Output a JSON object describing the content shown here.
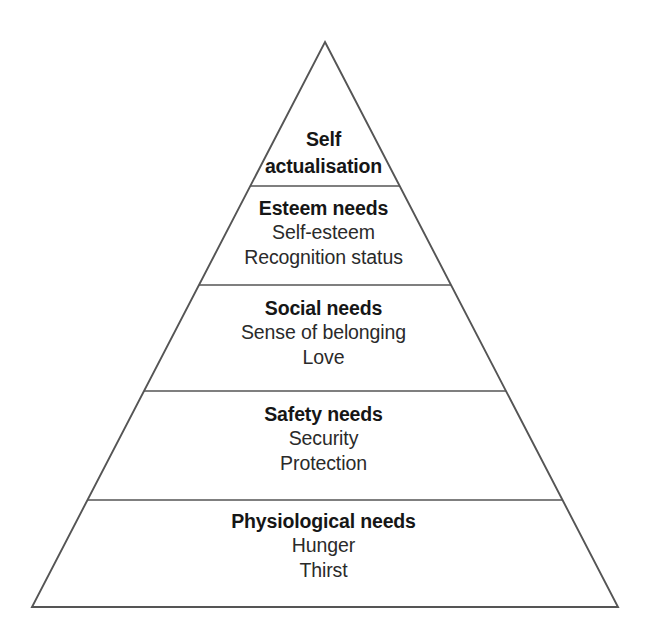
{
  "figure": {
    "name": "hierarchy-of-needs-pyramid",
    "shape": "triangle",
    "background_color": "#ffffff",
    "line_color": "#555555",
    "text_color": "#1a1a1a"
  },
  "geometry": {
    "apex": {
      "x": 325,
      "y": 42
    },
    "base_left": {
      "x": 32,
      "y": 607
    },
    "base_right": {
      "x": 618,
      "y": 607
    },
    "divider_y": [
      186,
      285,
      391,
      500
    ]
  },
  "pyramid": {
    "tiers": [
      {
        "id": "self-actualisation",
        "title_line_1": "Self",
        "title_line_2": "actualisation",
        "items": []
      },
      {
        "id": "esteem-needs",
        "title": "Esteem needs",
        "items": [
          "Self-esteem",
          "Recognition status"
        ]
      },
      {
        "id": "social-needs",
        "title": "Social needs",
        "items": [
          "Sense of belonging",
          "Love"
        ]
      },
      {
        "id": "safety-needs",
        "title": "Safety needs",
        "items": [
          "Security",
          "Protection"
        ]
      },
      {
        "id": "physiological-needs",
        "title": "Physiological needs",
        "items": [
          "Hunger",
          "Thirst"
        ]
      }
    ]
  }
}
